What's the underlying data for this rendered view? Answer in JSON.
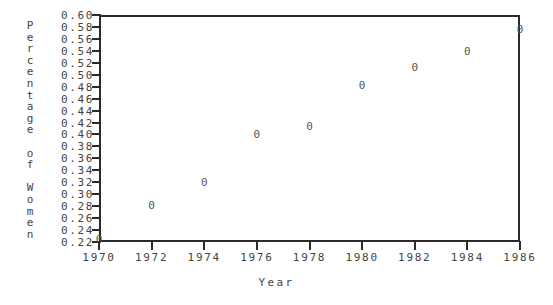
{
  "chart_data": {
    "type": "scatter",
    "title": "",
    "xlabel": "Year",
    "ylabel": "Percentage of Women",
    "ylabel_chars": [
      "P",
      "e",
      "r",
      "c",
      "e",
      "n",
      "t",
      "a",
      "g",
      "e",
      " ",
      "o",
      "f",
      " ",
      "W",
      "o",
      "m",
      "e",
      "n"
    ],
    "x": [
      1970,
      1972,
      1974,
      1976,
      1978,
      1980,
      1982,
      1984,
      1986
    ],
    "values": [
      0.225,
      0.282,
      0.321,
      0.401,
      0.415,
      0.482,
      0.513,
      0.54,
      0.576
    ],
    "points": [
      {
        "x": 1970,
        "y": 0.225
      },
      {
        "x": 1972,
        "y": 0.282
      },
      {
        "x": 1974,
        "y": 0.321
      },
      {
        "x": 1976,
        "y": 0.401
      },
      {
        "x": 1978,
        "y": 0.415
      },
      {
        "x": 1980,
        "y": 0.482
      },
      {
        "x": 1982,
        "y": 0.513
      },
      {
        "x": 1984,
        "y": 0.54
      },
      {
        "x": 1986,
        "y": 0.576
      }
    ],
    "marker": "0",
    "marker_color": "#555555",
    "axis_color": "#2b2b2b",
    "background": "#ffffff",
    "grid": false,
    "legend": null,
    "xlim": [
      1970,
      1986
    ],
    "ylim": [
      0.22,
      0.6
    ],
    "xticks": [
      1970,
      1972,
      1974,
      1976,
      1978,
      1980,
      1982,
      1984,
      1986
    ],
    "xtick_labels": [
      "1970",
      "1972",
      "1974",
      "1976",
      "1978",
      "1980",
      "1982",
      "1984",
      "1986"
    ],
    "yticks": [
      0.6,
      0.58,
      0.56,
      0.54,
      0.52,
      0.5,
      0.48,
      0.46,
      0.44,
      0.42,
      0.4,
      0.38,
      0.36,
      0.34,
      0.32,
      0.3,
      0.28,
      0.26,
      0.24,
      0.22
    ],
    "ytick_labels": [
      "0.60",
      "0.58",
      "0.56",
      "0.54",
      "0.52",
      "0.50",
      "0.48",
      "0.46",
      "0.44",
      "0.42",
      "0.40",
      "0.38",
      "0.36",
      "0.34",
      "0.32",
      "0.30",
      "0.28",
      "0.26",
      "0.24",
      "0.22"
    ]
  }
}
